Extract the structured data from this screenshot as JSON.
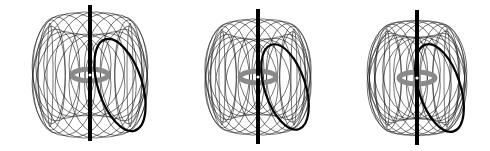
{
  "figure": {
    "panels": [
      {
        "id": "torus-1",
        "cx": 90,
        "cy": 75,
        "R": 40,
        "r": 40,
        "loops": 22,
        "axis_top": 5,
        "axis_bottom": 141
      },
      {
        "id": "torus-2",
        "cx": 258,
        "cy": 77,
        "R": 36,
        "r": 37,
        "loops": 22,
        "axis_top": 9,
        "axis_bottom": 144
      },
      {
        "id": "torus-3",
        "cx": 417,
        "cy": 78,
        "R": 30,
        "r": 38,
        "loops": 22,
        "axis_top": 10,
        "axis_bottom": 145
      }
    ],
    "colors": {
      "background": "#ffffff",
      "field_lines": "#1a1a1a",
      "highlight_loop": "#000000",
      "axis": "#000000",
      "center_ring": "#8a8a8a"
    }
  }
}
